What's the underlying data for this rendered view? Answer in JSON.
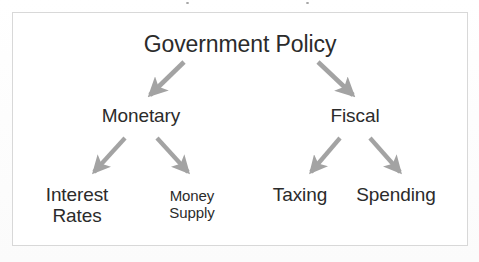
{
  "diagram": {
    "type": "hierarchy-tree",
    "title_node": "Government Policy",
    "frame_color": "#d8d8d8",
    "text_color": "#2b2b2b",
    "arrow_color": "#a3a3a3",
    "background_color": "#ffffff",
    "levels": [
      {
        "level": 1,
        "nodes": [
          {
            "id": "government-policy",
            "label": "Government Policy"
          }
        ]
      },
      {
        "level": 2,
        "nodes": [
          {
            "id": "monetary",
            "label": "Monetary"
          },
          {
            "id": "fiscal",
            "label": "Fiscal"
          }
        ]
      },
      {
        "level": 3,
        "nodes": [
          {
            "id": "interest-rates",
            "label": "Interest\nRates"
          },
          {
            "id": "money-supply",
            "label": "Money\nSupply"
          },
          {
            "id": "taxing",
            "label": "Taxing"
          },
          {
            "id": "spending",
            "label": "Spending"
          }
        ]
      }
    ],
    "edges": [
      {
        "id": "edge-policy-monetary",
        "from": "government-policy",
        "to": "monetary"
      },
      {
        "id": "edge-policy-fiscal",
        "from": "government-policy",
        "to": "fiscal"
      },
      {
        "id": "edge-monetary-interest-rates",
        "from": "monetary",
        "to": "interest-rates"
      },
      {
        "id": "edge-monetary-money-supply",
        "from": "monetary",
        "to": "money-supply"
      },
      {
        "id": "edge-fiscal-taxing",
        "from": "fiscal",
        "to": "taxing"
      },
      {
        "id": "edge-fiscal-spending",
        "from": "fiscal",
        "to": "spending"
      }
    ]
  }
}
